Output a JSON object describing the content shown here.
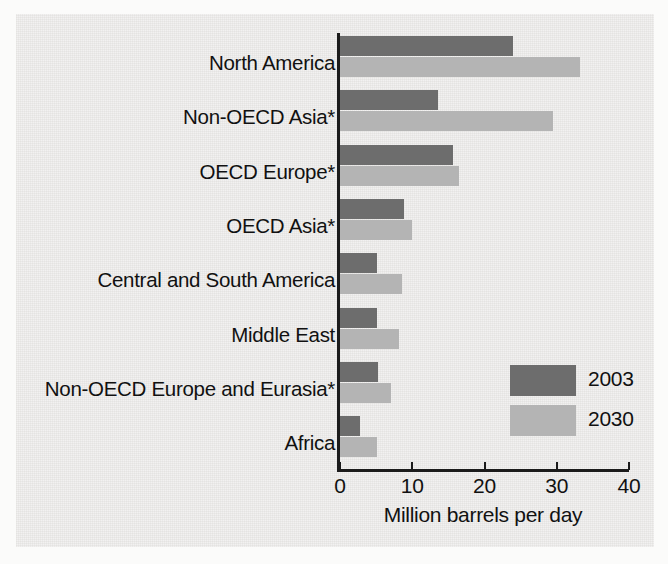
{
  "chart_data": {
    "type": "bar",
    "orientation": "horizontal",
    "title": "",
    "xlabel": "Million barrels per day",
    "ylabel": "",
    "xlim": [
      0,
      40
    ],
    "xticks": [
      0,
      10,
      20,
      30,
      40
    ],
    "xtick_labels": [
      "0",
      "10",
      "20",
      "30",
      "40"
    ],
    "grid": false,
    "legend_position": "inside-right",
    "categories": [
      "North America",
      "Non-OECD Asia*",
      "OECD Europe*",
      "OECD Asia*",
      "Central and South America",
      "Middle East",
      "Non-OECD Europe and Eurasia*",
      "Africa"
    ],
    "series": [
      {
        "name": "2003",
        "color": "#6d6d6d",
        "values": [
          24.0,
          13.6,
          15.6,
          8.9,
          5.1,
          5.1,
          5.3,
          2.8
        ]
      },
      {
        "name": "2030",
        "color": "#b4b4b4",
        "values": [
          33.2,
          29.5,
          16.5,
          10.0,
          8.6,
          8.2,
          7.1,
          5.1
        ]
      }
    ]
  },
  "legend": {
    "entries": [
      {
        "label": "2003",
        "color": "#6d6d6d"
      },
      {
        "label": "2030",
        "color": "#b4b4b4"
      }
    ]
  },
  "colors": {
    "background": "#f2f1ef",
    "axis": "#1b1b1b",
    "text": "#111111",
    "series_2003": "#6d6d6d",
    "series_2030": "#b4b4b4"
  }
}
